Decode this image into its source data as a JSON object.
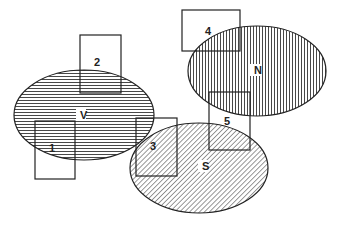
{
  "diagram": {
    "type": "overlap-diagram",
    "colors": {
      "stroke": "#222222",
      "hatch": "#333333",
      "background": "#ffffff"
    },
    "ellipses": [
      {
        "id": "V",
        "label": "V",
        "cx": 84,
        "cy": 115,
        "rx": 70,
        "ry": 45,
        "hatch": "horizontal",
        "label_x": 80,
        "label_y": 119
      },
      {
        "id": "N",
        "label": "N",
        "cx": 257,
        "cy": 71,
        "rx": 69,
        "ry": 45,
        "hatch": "vertical",
        "label_x": 254,
        "label_y": 74
      },
      {
        "id": "S",
        "label": "S",
        "cx": 199,
        "cy": 168,
        "rx": 69,
        "ry": 45,
        "hatch": "diagonal",
        "label_x": 202,
        "label_y": 170
      }
    ],
    "rectangles": [
      {
        "id": "1",
        "label": "1",
        "x": 35,
        "y": 121,
        "w": 40,
        "h": 58,
        "label_x": 52,
        "label_y": 152
      },
      {
        "id": "2",
        "label": "2",
        "x": 80,
        "y": 35,
        "w": 41,
        "h": 58,
        "label_x": 97,
        "label_y": 66
      },
      {
        "id": "3",
        "label": "3",
        "x": 136,
        "y": 118,
        "w": 41,
        "h": 58,
        "label_x": 153,
        "label_y": 150
      },
      {
        "id": "4",
        "label": "4",
        "x": 182,
        "y": 10,
        "w": 58,
        "h": 41,
        "label_x": 208,
        "label_y": 35
      },
      {
        "id": "5",
        "label": "5",
        "x": 209,
        "y": 92,
        "w": 41,
        "h": 58,
        "label_x": 227,
        "label_y": 125
      }
    ]
  }
}
